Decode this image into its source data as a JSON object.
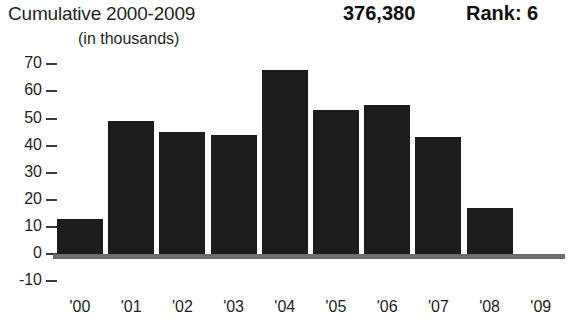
{
  "header": {
    "title": "Cumulative 2000-2009",
    "subtitle": "(in thousands)",
    "total": "376,380",
    "rank": "Rank: 6"
  },
  "chart_data": {
    "type": "bar",
    "title": "Cumulative 2000-2009",
    "subtitle": "(in thousands)",
    "xlabel": "",
    "ylabel": "",
    "categories": [
      "'00",
      "'01",
      "'02",
      "'03",
      "'04",
      "'05",
      "'06",
      "'07",
      "'08",
      "'09"
    ],
    "values": [
      13,
      49,
      45,
      44,
      68,
      53,
      55,
      43,
      17,
      -2
    ],
    "ylim": [
      -10,
      70
    ],
    "yticks": [
      70,
      60,
      50,
      40,
      30,
      20,
      10,
      0,
      -10
    ],
    "ytick_labels": [
      "70",
      "60",
      "50",
      "40",
      "30",
      "20",
      "10",
      "0",
      "-10"
    ],
    "grid": false,
    "legend": "none",
    "bar_color": "#1c1c1c",
    "axis_color": "#6d6d6d",
    "annotations": {
      "total_value": "376,380",
      "rank": "Rank: 6"
    }
  }
}
